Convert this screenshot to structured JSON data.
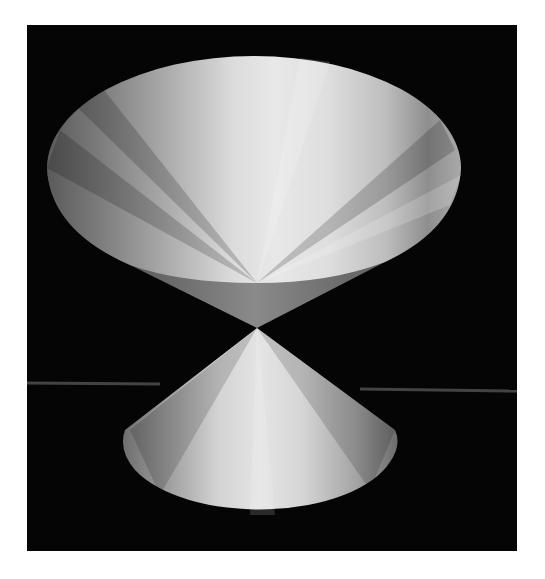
{
  "figure": {
    "background_color": "#050505",
    "page_color": "#ffffff",
    "frame": {
      "x": 27,
      "y": 25,
      "width": 490,
      "height": 526
    },
    "apex": {
      "x": 257,
      "y": 328
    },
    "upper_nappe": {
      "rim_ellipse": {
        "cx": 254,
        "cy": 168,
        "rx": 207,
        "ry": 112
      },
      "shade_light": "#e6e6e6",
      "shade_dark": "#6e6e6e",
      "inner_shell_color": "#7a7a7a"
    },
    "lower_nappe": {
      "base_ellipse": {
        "cx": 259,
        "cy": 447,
        "rx": 137,
        "ry": 68
      },
      "shade_light": "#e2e2e2",
      "shade_dark": "#777777"
    },
    "scan_line": {
      "y_left": 383,
      "y_right": 391,
      "color": "#6a6a6a"
    }
  }
}
